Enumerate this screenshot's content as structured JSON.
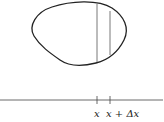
{
  "diagram": {
    "region": {
      "name": "closed-region",
      "stroke": "#222222"
    },
    "slice_lines": [
      {
        "name": "slice-left",
        "x": 97
      },
      {
        "name": "slice-right",
        "x": 110
      }
    ],
    "axis": {
      "name": "x-axis",
      "y": 100,
      "ticks": [
        {
          "name": "tick-x",
          "x": 97,
          "label": "x"
        },
        {
          "name": "tick-x-plus-dx",
          "x": 110,
          "label": "x + Δx"
        }
      ]
    }
  }
}
